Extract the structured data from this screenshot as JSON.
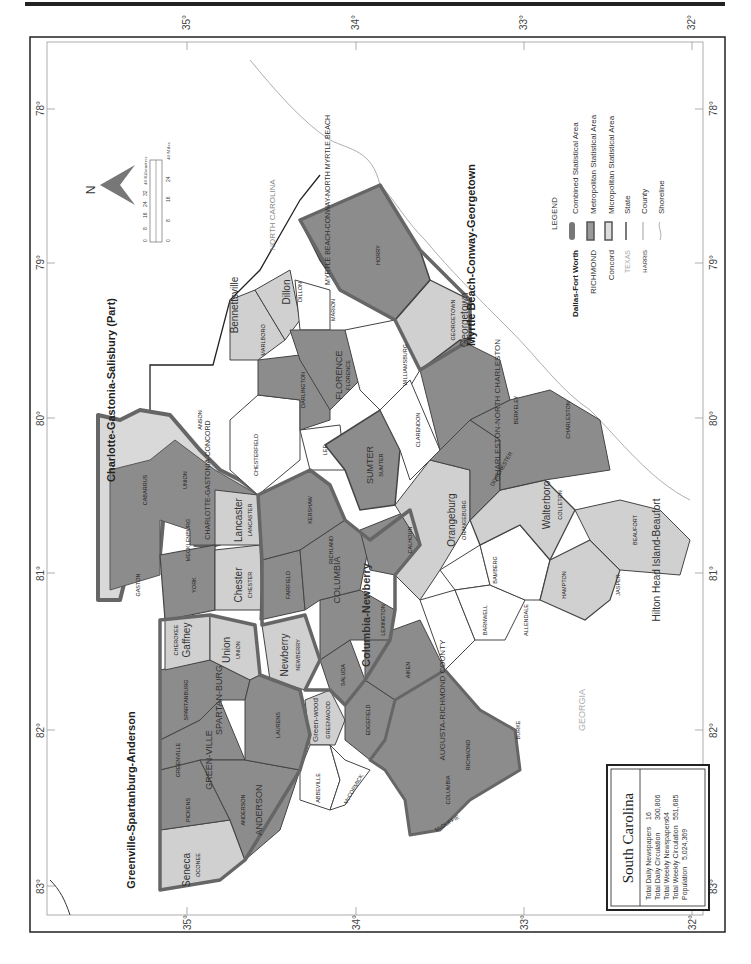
{
  "page": {
    "header_fragment": "...y Appendix",
    "orientation": "rotated -90deg (landscape map on portrait page)"
  },
  "map": {
    "title": "South Carolina",
    "latitude_ticks": [
      "35°",
      "34°",
      "33°",
      "32°"
    ],
    "longitude_ticks": [
      "78°",
      "79°",
      "80°",
      "81°",
      "82°",
      "83°"
    ],
    "neighbors": {
      "north": "NORTH CAROLINA",
      "southwest": "GEORGIA"
    },
    "csa_labels": [
      "Charlotte-Gastonia-Salisbury (Part)",
      "Greenville-Spartanburg-Anderson",
      "Myrtle Beach-Conway-Georgetown"
    ],
    "metro_labels": [
      "CHARLOTTE-GASTONIA-CONCORD",
      "SPARTAN-BURG",
      "GREEN-VILLE",
      "ANDERSON",
      "COLUMBIA",
      "FLORENCE",
      "SUMTER",
      "AUGUSTA-RICHMOND COUNTY",
      "CHARLESTON-NORTH CHARLESTON",
      "MYRTLE BEACH-CONWAY-NORTH MYRTLE BEACH"
    ],
    "micro_labels": [
      "Seneca",
      "Gaffney",
      "Union",
      "Chester",
      "Lancaster",
      "Newberry",
      "Green-wood",
      "Orangeburg",
      "Walterboro",
      "Dillon",
      "Georgetown",
      "Bennettsville",
      "Hilton Head Island-Beaufort",
      "Columbia-Newberry"
    ],
    "counties": [
      "OCONEE",
      "PICKENS",
      "GREENVILLE",
      "ANDERSON",
      "SPARTANBURG",
      "CHEROKEE",
      "UNION",
      "LAURENS",
      "ABBEVILLE",
      "GREENWOOD",
      "McCORMICK",
      "NEWBERRY",
      "SALUDA",
      "EDGEFIELD",
      "AIKEN",
      "LEXINGTON",
      "RICHLAND",
      "FAIRFIELD",
      "CHESTER",
      "YORK",
      "LANCASTER",
      "KERSHAW",
      "LEE",
      "SUMTER",
      "CALHOUN",
      "ORANGEBURG",
      "BARNWELL",
      "BAMBERG",
      "ALLENDALE",
      "HAMPTON",
      "JASPER",
      "BEAUFORT",
      "COLLETON",
      "DORCHESTER",
      "BERKELEY",
      "CHARLESTON",
      "CLARENDON",
      "WILLIAMSBURG",
      "FLORENCE",
      "DARLINGTON",
      "CHESTERFIELD",
      "MARLBORO",
      "DILLON",
      "MARION",
      "HORRY",
      "GEORGETOWN",
      "GASTON",
      "MECKLENBURG",
      "CABARRUS",
      "UNION",
      "ANSON",
      "COLUMBIA",
      "RICHMOND",
      "BURKE",
      "McDUFFIE"
    ],
    "legend": {
      "title": "LEGEND",
      "items": [
        {
          "sample": "Dallas-Fort Worth",
          "label": "Combined Statistical Area"
        },
        {
          "sample": "RICHMOND",
          "label": "Metropolitan Statistical Area"
        },
        {
          "sample": "Concord",
          "label": "Micropolitan Statistical Area"
        },
        {
          "sample": "TEXAS",
          "label": "State"
        },
        {
          "sample": "HARRIS",
          "label": "County"
        },
        {
          "sample": "",
          "label": "Shoreline"
        }
      ]
    },
    "scale_bar": {
      "km_ticks": [
        "0",
        "8",
        "16",
        "24",
        "32",
        "40 Kilometers"
      ],
      "mi_ticks": [
        "0",
        "8",
        "16",
        "24",
        "32",
        "40 Miles"
      ]
    },
    "north_arrow": "N",
    "colors": {
      "metro_fill": "#8c8c8c",
      "micro_fill": "#d0d0d0",
      "outside_fill": "#d9d9d9",
      "csa_border": "#555555",
      "county_line": "#333333",
      "white": "#ffffff"
    }
  },
  "info_box": {
    "title": "South Carolina",
    "rows": [
      {
        "label": "Total Daily Newspapers",
        "value": "16"
      },
      {
        "label": "Total Daily Circulation",
        "value": "300,806"
      },
      {
        "label": "Total Weekly Newspapers",
        "value": "64"
      },
      {
        "label": "Total Weekly Circulation",
        "value": "551,685"
      },
      {
        "label": "Population",
        "value": "5,024,369"
      }
    ]
  }
}
